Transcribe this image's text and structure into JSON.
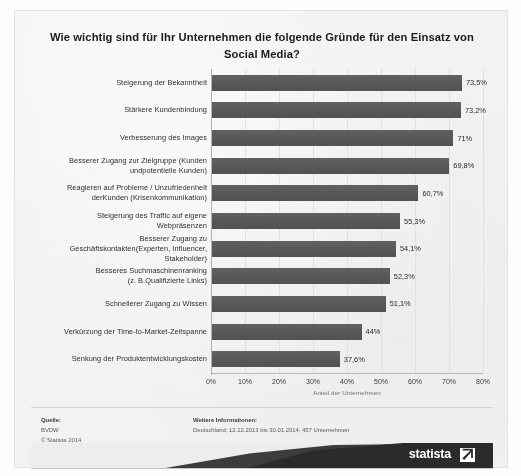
{
  "chart_data": {
    "type": "bar",
    "orientation": "horizontal",
    "title": "Wie wichtig sind für Ihr Unternehmen die folgende Gründe für den Einsatz von Social Media?",
    "categories": [
      "Steigerung der Bekanntheit",
      "Stärkere Kundenbindung",
      "Verbesserung des Images",
      "Besserer Zugang zur Zielgruppe (Kunden undpotentielle Kunden)",
      "Reagieren auf Probleme / Unzufriedenheit derKunden (Krisenkommunikation)",
      "Steigerung des Traffic auf eigene Webpräsenzen",
      "Besserer Zugang zu Geschäftskontakten(Experten, Influencer, Stakeholder)",
      "Besseres Suchmaschinenranking (z. B.Qualifizierte Links)",
      "Schnellerer Zugang zu Wissen",
      "Verkürzung der Time-to-Market-Zeitspanne",
      "Senkung der Produktentwicklungskosten"
    ],
    "values": [
      73.5,
      73.2,
      71.0,
      69.8,
      60.7,
      55.3,
      54.1,
      52.3,
      51.1,
      44.0,
      37.6
    ],
    "value_labels": [
      "73,5%",
      "73,2%",
      "71%",
      "69,8%",
      "60,7%",
      "55,3%",
      "54,1%",
      "52,3%",
      "51,1%",
      "44%",
      "37,6%"
    ],
    "xlabel": "Anteil der Unternehmen",
    "ylabel": "",
    "xlim": [
      0,
      80
    ],
    "xtick_labels": [
      "0%",
      "10%",
      "20%",
      "30%",
      "40%",
      "50%",
      "60%",
      "70%",
      "80%"
    ],
    "xtick_values": [
      0,
      10,
      20,
      30,
      40,
      50,
      60,
      70,
      80
    ],
    "grid": true,
    "legend": "none",
    "bar_color": "#595959",
    "background_color": "#f2f2f2"
  },
  "rows": [
    {
      "label_lines": [
        "Steigerung der Bekanntheit"
      ],
      "value": 73.5,
      "value_label": "73,5%"
    },
    {
      "label_lines": [
        "Stärkere Kundenbindung"
      ],
      "value": 73.2,
      "value_label": "73,2%"
    },
    {
      "label_lines": [
        "Verbesserung des Images"
      ],
      "value": 71.0,
      "value_label": "71%"
    },
    {
      "label_lines": [
        "Besserer Zugang zur Zielgruppe (Kunden",
        "undpotentielle Kunden)"
      ],
      "value": 69.8,
      "value_label": "69,8%"
    },
    {
      "label_lines": [
        "Reagieren auf Probleme / Unzufriedenheit",
        "derKunden (Krisenkommunikation)"
      ],
      "value": 60.7,
      "value_label": "60,7%"
    },
    {
      "label_lines": [
        "Steigerung des Traffic auf eigene",
        "Webpräsenzen"
      ],
      "value": 55.3,
      "value_label": "55,3%"
    },
    {
      "label_lines": [
        "Besserer Zugang zu",
        "Geschäftskontakten(Experten, Influencer,",
        "Stakeholder)"
      ],
      "value": 54.1,
      "value_label": "54,1%"
    },
    {
      "label_lines": [
        "Besseres Suchmaschinenranking",
        "(z. B.Qualifizierte Links)"
      ],
      "value": 52.3,
      "value_label": "52,3%"
    },
    {
      "label_lines": [
        "Schnellerer Zugang zu Wissen"
      ],
      "value": 51.1,
      "value_label": "51,1%"
    },
    {
      "label_lines": [
        "Verkürzung der Time-to-Market-Zeitspanne"
      ],
      "value": 44.0,
      "value_label": "44%"
    },
    {
      "label_lines": [
        "Senkung der Produktentwicklungskosten"
      ],
      "value": 37.6,
      "value_label": "37,6%"
    }
  ],
  "footer": {
    "source_head": "Quelle:",
    "source_lines": [
      "BVDW",
      "© Statista 2014"
    ],
    "info_head": "Weitere Informationen:",
    "info_lines": [
      "Deutschland; 12.12.2013 bis 30.01.2014; 457 Unternehmen"
    ],
    "logo_text": "statista"
  }
}
